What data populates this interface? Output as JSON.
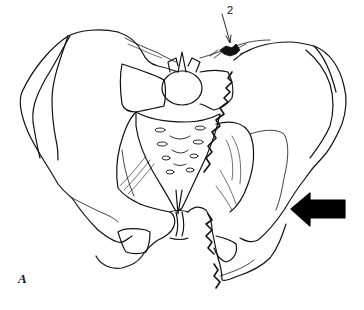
{
  "figure": {
    "callout_label": "2",
    "panel_label": "A",
    "arrow": {
      "direction": "left",
      "color": "#000000"
    }
  },
  "colors": {
    "line": "#111111",
    "background": "#ffffff"
  }
}
